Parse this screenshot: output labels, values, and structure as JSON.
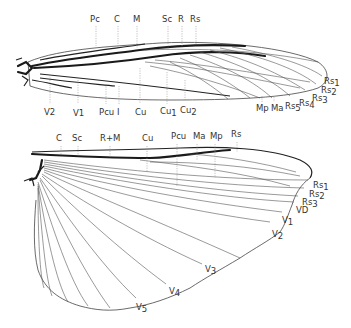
{
  "figure": {
    "forewing": {
      "top_labels": [
        {
          "text": "Pc",
          "x": 94,
          "y": 22
        },
        {
          "text": "C",
          "x": 116,
          "y": 22
        },
        {
          "text": "M",
          "x": 135,
          "y": 22
        },
        {
          "text": "Sc",
          "x": 164,
          "y": 22
        },
        {
          "text": "R",
          "x": 179,
          "y": 22
        },
        {
          "text": "Rs",
          "x": 192,
          "y": 22
        }
      ],
      "bottom_labels": [
        {
          "text": "V2",
          "x": 46,
          "y": 116
        },
        {
          "text": "V1",
          "x": 75,
          "y": 116
        },
        {
          "text": "Pcu",
          "x": 100,
          "y": 116
        },
        {
          "text": "I",
          "x": 118,
          "y": 116
        },
        {
          "text": "Cu",
          "x": 137,
          "y": 116
        },
        {
          "text": "Cu",
          "sub": "1",
          "x": 160,
          "y": 116
        },
        {
          "text": "Cu",
          "sub": "2",
          "x": 181,
          "y": 113
        }
      ],
      "right_labels": [
        {
          "text": "Mp",
          "x": 256,
          "y": 112
        },
        {
          "text": "Ma",
          "x": 272,
          "y": 112
        },
        {
          "text": "Rs",
          "sub": "5",
          "x": 285,
          "y": 110
        },
        {
          "text": "Rs",
          "sub": "4",
          "x": 299,
          "y": 107
        },
        {
          "text": "Rs",
          "sub": "3",
          "x": 313,
          "y": 102
        },
        {
          "text": "Rs",
          "sub": "2",
          "x": 321,
          "y": 94
        },
        {
          "text": "Rs",
          "sub": "1",
          "x": 325,
          "y": 85
        }
      ]
    },
    "hindwing": {
      "top_labels": [
        {
          "text": "C",
          "x": 57,
          "y": 141
        },
        {
          "text": "Sc",
          "x": 73,
          "y": 141
        },
        {
          "text": "R+M",
          "x": 101,
          "y": 141
        },
        {
          "text": "Cu",
          "x": 141,
          "y": 141
        },
        {
          "text": "Pcu",
          "x": 171,
          "y": 139
        },
        {
          "text": "Ma",
          "x": 193,
          "y": 139
        },
        {
          "text": "Mp",
          "x": 210,
          "y": 139
        },
        {
          "text": "Rs",
          "x": 232,
          "y": 137
        }
      ],
      "right_labels": [
        {
          "text": "Rs",
          "sub": "1",
          "x": 313,
          "y": 188
        },
        {
          "text": "Rs",
          "sub": "2",
          "x": 309,
          "y": 197
        },
        {
          "text": "Rs",
          "sub": "3",
          "x": 302,
          "y": 205
        },
        {
          "text": "VD",
          "x": 296,
          "y": 213
        },
        {
          "text": "V",
          "sub": "1",
          "x": 282,
          "y": 223
        },
        {
          "text": "V",
          "sub": "2",
          "x": 272,
          "y": 238
        },
        {
          "text": "V",
          "sub": "3",
          "x": 205,
          "y": 273
        },
        {
          "text": "V",
          "sub": "4",
          "x": 170,
          "y": 295
        },
        {
          "text": "V",
          "sub": "5",
          "x": 136,
          "y": 311
        }
      ]
    }
  }
}
